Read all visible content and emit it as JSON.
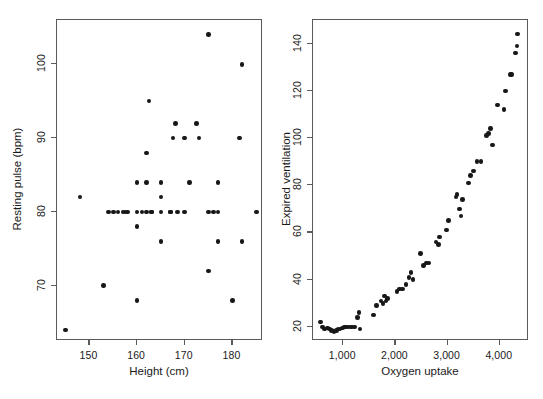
{
  "figure": {
    "background": "#ffffff",
    "point_color": "#171717",
    "axis_color": "#5a5a5a",
    "text_color": "#1a1a1a"
  },
  "chart_data": [
    {
      "type": "scatter",
      "panel": "left",
      "title": "",
      "xlabel": "Height (cm)",
      "ylabel": "Resting pulse (bpm)",
      "xlim": [
        143.2,
        186.4
      ],
      "ylim": [
        62.5,
        106.0
      ],
      "xticks": [
        150,
        160,
        170,
        180
      ],
      "xticklabels": [
        "150",
        "160",
        "170",
        "180"
      ],
      "yticks": [
        70,
        80,
        90,
        100
      ],
      "yticklabels": [
        "70",
        "80",
        "90",
        "100"
      ],
      "grid": false,
      "legend": false,
      "x": [
        145,
        148,
        153,
        154,
        155,
        156,
        157,
        157.5,
        158,
        160,
        160,
        160,
        160,
        161,
        162,
        162,
        162,
        162.5,
        163,
        163,
        165,
        165,
        165,
        165,
        167,
        167,
        167.5,
        168,
        168.5,
        170,
        170,
        171,
        172.5,
        173,
        175,
        175,
        175,
        176,
        177,
        177,
        177,
        180,
        181.5,
        182,
        182,
        185
      ],
      "y": [
        64,
        82,
        70,
        80,
        80,
        80,
        80,
        80,
        80,
        68,
        78,
        80,
        84,
        80,
        80,
        84,
        88,
        95,
        80,
        80,
        76,
        80,
        82,
        84,
        80,
        80,
        90,
        92,
        80,
        80,
        90,
        84,
        92,
        90,
        72,
        80,
        104,
        80,
        76,
        80,
        84,
        68,
        90,
        76,
        100,
        80
      ]
    },
    {
      "type": "scatter",
      "panel": "right",
      "title": "",
      "xlabel": "Oxygen uptake",
      "ylabel": "Expired ventilation",
      "xlim": [
        420,
        4560
      ],
      "ylim": [
        14,
        150
      ],
      "xticks": [
        1000,
        2000,
        3000,
        4000
      ],
      "xticklabels": [
        "1,000",
        "2,000",
        "3,000",
        "4,000"
      ],
      "yticks": [
        20,
        40,
        60,
        80,
        100,
        120,
        140
      ],
      "yticklabels": [
        "20",
        "40",
        "60",
        "80",
        "100",
        "120",
        "140"
      ],
      "grid": false,
      "legend": false,
      "x": [
        560,
        600,
        640,
        700,
        740,
        780,
        820,
        870,
        900,
        940,
        980,
        1020,
        1060,
        1110,
        1160,
        1210,
        1270,
        1300,
        1320,
        1580,
        1640,
        1720,
        1760,
        1790,
        1820,
        1850,
        2030,
        2080,
        2140,
        2200,
        2260,
        2300,
        2340,
        2480,
        2540,
        2600,
        2640,
        2780,
        2820,
        2840,
        2980,
        3020,
        3160,
        3180,
        3230,
        3260,
        3290,
        3400,
        3440,
        3500,
        3560,
        3640,
        3740,
        3780,
        3820,
        3860,
        3960,
        4080,
        4110,
        4200,
        4220,
        4300,
        4330,
        4340
      ],
      "y": [
        22,
        20,
        19,
        19.5,
        19,
        18.5,
        18,
        18.5,
        19,
        19,
        19.5,
        20,
        20,
        20,
        20,
        20,
        24,
        26,
        19,
        25,
        29,
        31,
        30,
        33,
        31,
        32,
        35,
        36,
        36,
        38,
        41,
        43,
        40,
        51,
        46,
        47,
        47,
        56,
        55,
        58,
        61,
        65,
        75,
        76,
        70,
        67,
        74,
        81,
        84,
        86,
        90,
        90,
        101,
        102,
        104,
        97,
        114,
        112,
        120,
        127,
        127,
        136,
        139,
        144
      ]
    }
  ]
}
